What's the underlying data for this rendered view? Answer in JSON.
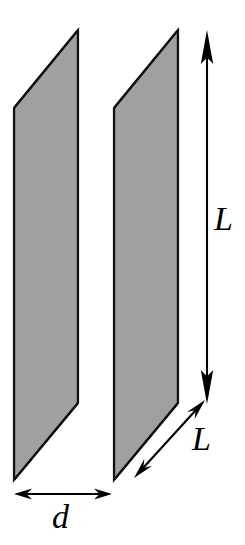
{
  "figure": {
    "background_color": "#ffffff",
    "plate_fill_color": "#a3a3a3",
    "plate_edge_color": "#111111",
    "annotation_color": "#000000",
    "labels": {
      "height_label": "L",
      "depth_label": "L",
      "separation_label": "d"
    },
    "icons": {
      "height_dimension": "double-headed-vertical-arrow",
      "depth_dimension": "double-headed-diagonal-arrow",
      "separation_dimension": "double-headed-horizontal-arrow"
    },
    "plates": [
      {
        "name": "front-plate",
        "points": "14,108 78,30 78,403 14,480",
        "fill": "#a3a3a3"
      },
      {
        "name": "back-plate",
        "points": "114,108 178,30 178,403 114,480",
        "fill": "#a3a3a3"
      }
    ],
    "dimensions": {
      "height_arrow": {
        "x": 207,
        "y1": 30,
        "y2": 404
      },
      "depth_arrow": {
        "x1": 134,
        "y1": 478,
        "x2": 205,
        "y2": 400
      },
      "separation_arrow": {
        "y": 494,
        "x1": 14,
        "x2": 112
      }
    }
  }
}
